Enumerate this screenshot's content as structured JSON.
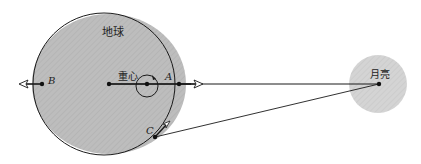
{
  "labels": {
    "earth": "地球",
    "moon": "月亮",
    "barycenter": "重心",
    "point_a": "A",
    "point_b": "B",
    "point_c": "C"
  },
  "colors": {
    "body_fill": "#b9b9b9",
    "moon_fill": "#d2d2d2",
    "line": "#1a1a1a",
    "background": "#ffffff"
  }
}
